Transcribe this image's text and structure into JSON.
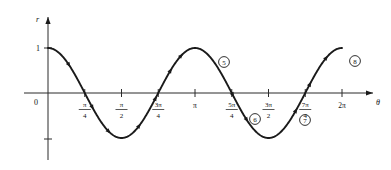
{
  "figure": {
    "title": "",
    "caption": ""
  },
  "axes": {
    "x_axis_label": "θ",
    "y_axis_label": "r",
    "origin_label": "0",
    "y_tick_label": "1"
  },
  "x_ticks": [
    {
      "name": "pi-over-4",
      "whole": "",
      "num": "π",
      "den": "4",
      "theta": 0.7853981634
    },
    {
      "name": "pi-over-2",
      "whole": "",
      "num": "π",
      "den": "2",
      "theta": 1.5707963268
    },
    {
      "name": "3pi-over-4",
      "whole": "",
      "num": "3π",
      "den": "4",
      "theta": 2.3561944902
    },
    {
      "name": "pi",
      "whole": "π",
      "num": "",
      "den": "",
      "theta": 3.1415926536
    },
    {
      "name": "5pi-over-4",
      "whole": "",
      "num": "5π",
      "den": "4",
      "theta": 3.926990817
    },
    {
      "name": "3pi-over-2",
      "whole": "",
      "num": "3π",
      "den": "2",
      "theta": 4.7123889804
    },
    {
      "name": "7pi-over-4",
      "whole": "",
      "num": "7π",
      "den": "4",
      "theta": 5.4977871438
    },
    {
      "name": "2pi",
      "whole": "2π",
      "num": "",
      "den": "",
      "theta": 6.2831853072
    }
  ],
  "region_labels": [
    {
      "name": "region-5",
      "text": "5",
      "x": 224,
      "y": 62
    },
    {
      "name": "region-6",
      "text": "6",
      "x": 255,
      "y": 119
    },
    {
      "name": "region-7",
      "text": "7",
      "x": 305,
      "y": 120
    },
    {
      "name": "region-8",
      "text": "8",
      "x": 355,
      "y": 61
    }
  ],
  "chart_data": {
    "type": "line",
    "title": "",
    "xlabel": "θ",
    "ylabel": "r",
    "function": "r = cos(2θ)",
    "xlim": [
      0,
      6.2831853072
    ],
    "ylim": [
      -1,
      1
    ],
    "grid": false,
    "legend": "none",
    "x_tick_labels": [
      "0",
      "π/4",
      "π/2",
      "3π/4",
      "π",
      "5π/4",
      "3π/2",
      "7π/4",
      "2π"
    ],
    "x_tick_values": [
      0,
      0.7853981634,
      1.5707963268,
      2.3561944902,
      3.1415926536,
      3.926990817,
      4.7123889804,
      5.4977871438,
      6.2831853072
    ],
    "y_tick_labels": [
      "1"
    ],
    "y_tick_values": [
      1
    ],
    "x": [
      0,
      0.19634954,
      0.39269908,
      0.58904862,
      0.78539816,
      0.9817477,
      1.17809725,
      1.37444679,
      1.57079633,
      1.76714587,
      1.96349541,
      2.15984495,
      2.35619449,
      2.55254403,
      2.74889357,
      2.94524311,
      3.14159265,
      3.3379422,
      3.53429174,
      3.73064128,
      3.92699082,
      4.12334036,
      4.3196899,
      4.51603944,
      4.71238898,
      4.90873852,
      5.10508806,
      5.30143761,
      5.49778715,
      5.69413669,
      5.89048623,
      6.08683577,
      6.28318531
    ],
    "y": [
      1.0,
      0.92388,
      0.70711,
      0.38268,
      0.0,
      -0.38268,
      -0.70711,
      -0.92388,
      -1.0,
      -0.92388,
      -0.70711,
      -0.38268,
      0.0,
      0.38268,
      0.70711,
      0.92388,
      1.0,
      0.92388,
      0.70711,
      0.38268,
      0.0,
      -0.38268,
      -0.70711,
      -0.92388,
      -1.0,
      -0.92388,
      -0.70711,
      -0.38268,
      0.0,
      0.38268,
      0.70711,
      0.92388,
      1.0
    ],
    "annotations": [
      {
        "label": "5",
        "circled": true,
        "near_theta": 3.55,
        "note": "branch label between pi and 5pi/4"
      },
      {
        "label": "6",
        "circled": true,
        "near_theta": 4.4,
        "note": "branch label between 5pi/4 and 3pi/2"
      },
      {
        "label": "7",
        "circled": true,
        "near_theta": 5.4,
        "note": "branch label near 7pi/4"
      },
      {
        "label": "8",
        "circled": true,
        "near_theta": 6.1,
        "note": "branch label near 2pi"
      }
    ],
    "direction_arrows": true,
    "arrow_count": 16
  }
}
